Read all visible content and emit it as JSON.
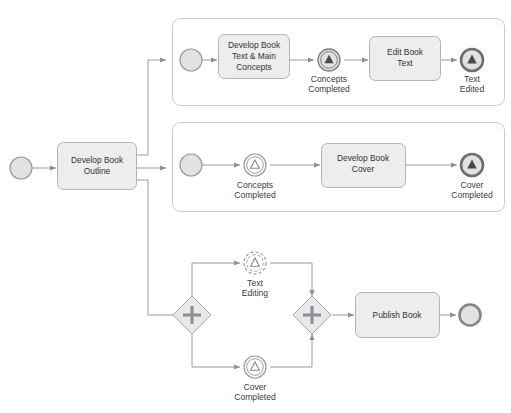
{
  "diagram": {
    "type": "bpmn-process-diagram",
    "colors": {
      "task_fill": "#ededee",
      "task_stroke": "#b4b4b8",
      "event_fill": "#e2e2e4",
      "event_stroke": "#9a9a9e",
      "gateway_fill": "#e8e8ea",
      "gateway_stroke": "#a8a8ac",
      "flow_stroke": "#9a9a9e",
      "lane_stroke": "#c9c9cd",
      "text": "#3a3a3a"
    }
  },
  "main_flow": {
    "start_event": {
      "name": "start-event"
    },
    "task_outline": {
      "label_line1": "Develop Book",
      "label_line2": "Outline"
    }
  },
  "lane_text": {
    "label_line1": "Develop Book",
    "label_line2": "Text & Main",
    "label_line3": "Concepts",
    "start_event": {
      "name": "subprocess-start-event-text"
    },
    "event_concepts_completed": {
      "label_line1": "Concepts",
      "label_line2": "Completed"
    },
    "task_edit": {
      "label_line1": "Edit Book",
      "label_line2": "Text"
    },
    "end_event_text_edited": {
      "label_line1": "Text",
      "label_line2": "Edited"
    }
  },
  "lane_cover": {
    "start_event": {
      "name": "subprocess-start-event-cover"
    },
    "event_concepts_completed": {
      "label_line1": "Concepts",
      "label_line2": "Completed"
    },
    "task_cover": {
      "label_line1": "Develop Book",
      "label_line2": "Cover"
    },
    "end_event_cover_completed": {
      "label_line1": "Cover",
      "label_line2": "Completed"
    }
  },
  "lane_publish": {
    "gateway_split": {
      "symbol": "+",
      "name": "parallel-gateway-split"
    },
    "gateway_join": {
      "symbol": "+",
      "name": "parallel-gateway-join"
    },
    "event_text_editing": {
      "label_line1": "Text",
      "label_line2": "Editing"
    },
    "event_cover_completed": {
      "label_line1": "Cover",
      "label_line2": "Completed"
    },
    "task_publish": {
      "label": "Publish Book"
    },
    "end_event": {
      "name": "process-end-event"
    }
  }
}
